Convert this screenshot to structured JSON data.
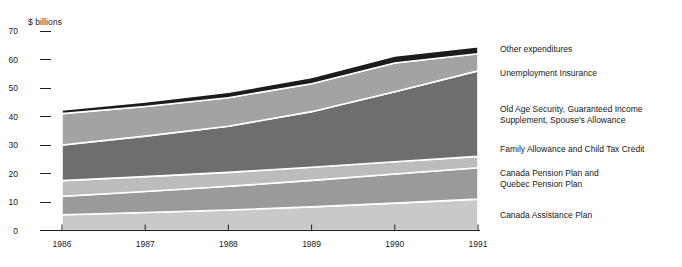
{
  "chart_data": {
    "type": "area",
    "title": "",
    "subtitle": "",
    "xlabel": "",
    "ylabel": "$ billions",
    "x": [
      1986,
      1987,
      1988,
      1989,
      1990,
      1991
    ],
    "xtick_labels": [
      "1986",
      "1987",
      "1988",
      "1989",
      "1990",
      "1991"
    ],
    "ytick_labels": [
      "70",
      "60",
      "50",
      "40",
      "30",
      "20",
      "10",
      "0"
    ],
    "ytick_values": [
      70,
      60,
      50,
      40,
      30,
      20,
      10,
      0
    ],
    "ylim": [
      0,
      70
    ],
    "xlim": [
      1986,
      1991
    ],
    "grid": false,
    "legend_position": "right",
    "stacked": true,
    "stack_order_bottom_to_top": [
      "Canada Assistance Plan",
      "Canada Pension Plan and Quebec Pension Plan",
      "Family Allowance and Child Tax Credit",
      "Old Age Security, Guaranteed Income Supplement, Spouse's Allowance",
      "Unemployment Insurance",
      "Other expenditures"
    ],
    "series": [
      {
        "name": "Canada Assistance Plan",
        "legend_label": "Canada Assistance Plan",
        "color": "#c9c9c9",
        "values": [
          5.5,
          6.3,
          7.2,
          8.3,
          9.6,
          11.0
        ]
      },
      {
        "name": "Canada Pension Plan and Quebec Pension Plan",
        "legend_label": "Canada Pension Plan and\nQuebec Pension Plan",
        "color": "#9a9a9a",
        "values": [
          6.5,
          7.4,
          8.3,
          9.3,
          10.2,
          11.0
        ]
      },
      {
        "name": "Family Allowance and Child Tax Credit",
        "legend_label": "Family Allowance and Child Tax Credit",
        "color": "#bcbcbc",
        "values": [
          5.5,
          5.2,
          4.9,
          4.6,
          4.3,
          4.0
        ]
      },
      {
        "name": "Old Age Security, Guaranteed Income Supplement, Spouse's Allowance",
        "legend_label": "Old Age Security, Guaranteed Income\nSupplement, Spouse's Allowance",
        "color": "#6e6e6e",
        "values": [
          12.5,
          14.2,
          16.2,
          19.5,
          24.6,
          30.0
        ]
      },
      {
        "name": "Unemployment Insurance",
        "legend_label": "Unemployment Insurance",
        "color": "#a3a3a3",
        "values": [
          11.0,
          10.4,
          10.0,
          9.8,
          10.1,
          6.0
        ]
      },
      {
        "name": "Other expenditures",
        "legend_label": "Other expenditures",
        "color": "#1c1c1c",
        "values": [
          1.3,
          1.6,
          1.9,
          2.2,
          2.4,
          2.5
        ]
      }
    ],
    "cumulative_tops": {
      "Canada Assistance Plan": [
        5.5,
        6.3,
        7.2,
        8.3,
        9.6,
        11.0
      ],
      "Canada Pension Plan and Quebec Pension Plan": [
        12.0,
        13.7,
        15.5,
        17.6,
        19.8,
        22.0
      ],
      "Family Allowance and Child Tax Credit": [
        17.5,
        18.9,
        20.4,
        22.2,
        24.1,
        26.0
      ],
      "Old Age Security, Guaranteed Income Supplement, Spouse's Allowance": [
        30.0,
        33.1,
        36.6,
        41.7,
        48.7,
        56.0
      ],
      "Unemployment Insurance": [
        41.0,
        43.5,
        46.6,
        51.5,
        58.8,
        62.0
      ],
      "Other expenditures": [
        42.3,
        45.1,
        48.5,
        53.7,
        61.2,
        64.5
      ]
    },
    "totals": [
      42.3,
      45.1,
      48.5,
      53.7,
      61.2,
      64.5
    ],
    "colors": {
      "axis": "#202020",
      "text": "#202020",
      "background": "#ffffff",
      "separator": "#ffffff"
    }
  },
  "legend": {
    "entries": [
      {
        "label": "Other expenditures"
      },
      {
        "label": "Unemployment Insurance"
      },
      {
        "label": "Old Age Security, Guaranteed Income\nSupplement, Spouse's Allowance"
      },
      {
        "label": "Family Allowance and Child Tax Credit"
      },
      {
        "label": "Canada Pension Plan and\nQuebec Pension Plan"
      },
      {
        "label": "Canada Assistance Plan"
      }
    ]
  },
  "axes": {
    "y_unit": "$ billions",
    "y_labels": [
      "70",
      "60",
      "50",
      "40",
      "30",
      "20",
      "10",
      "0"
    ],
    "x_labels": [
      "1986",
      "1987",
      "1988",
      "1989",
      "1990",
      "1991"
    ]
  }
}
